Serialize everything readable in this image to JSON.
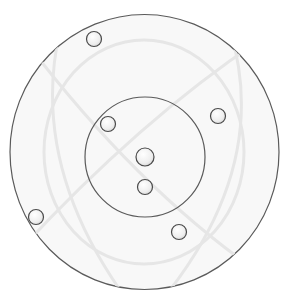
{
  "diagram": {
    "background": "#ffffff",
    "stroke_color": "#555555",
    "fill_color": "#f7f7f7",
    "outer_circle": {
      "cx": 144.5,
      "cy": 152,
      "rx": 134.5,
      "ry": 137.5
    },
    "inner_circle": {
      "cx": 145,
      "cy": 157,
      "r": 60
    },
    "nodes": [
      {
        "id": "node-1",
        "cx": 94,
        "cy": 39,
        "r": 7.5
      },
      {
        "id": "node-2",
        "cx": 218,
        "cy": 116,
        "r": 7.5
      },
      {
        "id": "node-3",
        "cx": 108,
        "cy": 124,
        "r": 7.5
      },
      {
        "id": "node-center",
        "cx": 145,
        "cy": 157,
        "r": 9
      },
      {
        "id": "node-4",
        "cx": 145,
        "cy": 187,
        "r": 7.5
      },
      {
        "id": "node-5",
        "cx": 36,
        "cy": 217,
        "r": 7.5
      },
      {
        "id": "node-6",
        "cx": 179,
        "cy": 232,
        "r": 7.5
      }
    ]
  },
  "caption": {
    "text": ""
  }
}
